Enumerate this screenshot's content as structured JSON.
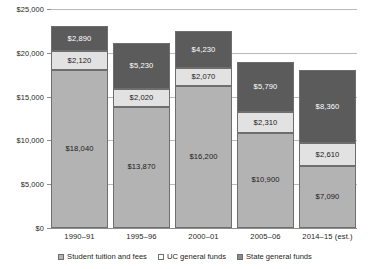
{
  "chart_data": {
    "type": "bar",
    "subtype": "stacked-bar",
    "title": "",
    "subtitle": "",
    "xlabel": "",
    "ylabel": "",
    "categories": [
      "1990–91",
      "1995–96",
      "2000–01",
      "2005–06",
      "2014–15 (est.)"
    ],
    "series": [
      {
        "name": "Student tuition and fees",
        "color": "#b3b3b3",
        "values": [
          18040,
          13870,
          16200,
          10900,
          7090
        ],
        "labels": [
          "$18,040",
          "$13,870",
          "$16,200",
          "$10,900",
          "$7,090"
        ]
      },
      {
        "name": "UC general funds",
        "color": "#e2e2e2",
        "values": [
          2120,
          2020,
          2070,
          2310,
          2610
        ],
        "labels": [
          "$2,120",
          "$2,020",
          "$2,070",
          "$2,310",
          "$2,610"
        ]
      },
      {
        "name": "State general funds",
        "color": "#5b5b5b",
        "values": [
          2890,
          5230,
          4230,
          5790,
          8360
        ],
        "labels": [
          "$2,890",
          "$5,230",
          "$4,230",
          "$5,790",
          "$8,360"
        ]
      }
    ],
    "totals": [
      23050,
      21120,
      22500,
      19000,
      18060
    ],
    "ylim": [
      0,
      25000
    ],
    "ytick_values": [
      0,
      5000,
      10000,
      15000,
      20000,
      25000
    ],
    "ytick_labels": [
      "$0",
      "$5,000",
      "$10,000",
      "$15,000",
      "$20,000",
      "$25,000"
    ],
    "grid": true,
    "grid_axis": "y",
    "legend_position": "bottom-center",
    "legend": [
      "Student tuition and fees",
      "UC general funds",
      "State general funds"
    ]
  },
  "legend_swatches": {
    "tuition": "#b3b3b3",
    "uc": "#ffffff",
    "state": "#8a8a8a"
  }
}
